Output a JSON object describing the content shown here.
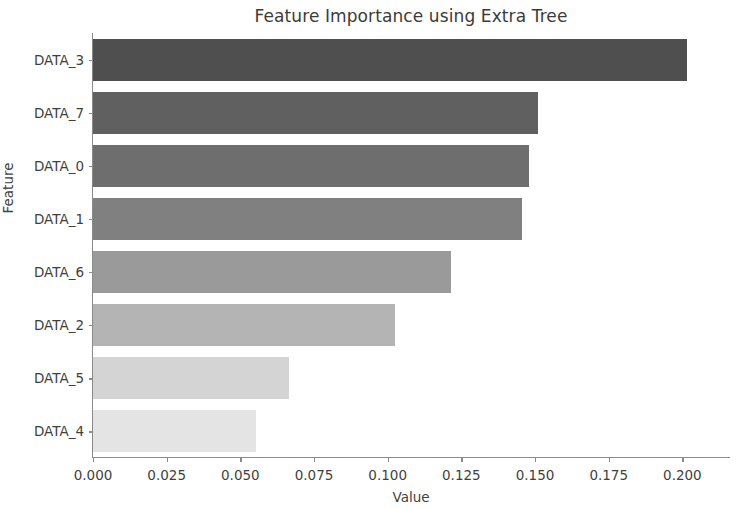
{
  "chart_data": {
    "type": "bar",
    "orientation": "horizontal",
    "title": "Feature Importance using Extra Tree",
    "xlabel": "Value",
    "ylabel": "Feature",
    "categories": [
      "DATA_3",
      "DATA_7",
      "DATA_0",
      "DATA_1",
      "DATA_6",
      "DATA_2",
      "DATA_5",
      "DATA_4"
    ],
    "values": [
      0.2015,
      0.151,
      0.148,
      0.1455,
      0.1215,
      0.1025,
      0.0665,
      0.0554
    ],
    "bar_colors": [
      "#4f4f4f",
      "#606060",
      "#6e6e6e",
      "#808080",
      "#9a9a9a",
      "#b4b4b4",
      "#d4d4d4",
      "#e4e4e4"
    ],
    "xlim": [
      0.0,
      0.2165
    ],
    "ylim_categories": 8,
    "xticks": [
      0.0,
      0.025,
      0.05,
      0.075,
      0.1,
      0.125,
      0.15,
      0.175,
      0.2
    ],
    "xtick_labels": [
      "0.000",
      "0.025",
      "0.050",
      "0.075",
      "0.100",
      "0.125",
      "0.150",
      "0.175",
      "0.200"
    ],
    "grid": false,
    "legend": null,
    "axis_color": "#8a8a8a",
    "text_color": "#3f3f3f",
    "background": "#ffffff"
  }
}
